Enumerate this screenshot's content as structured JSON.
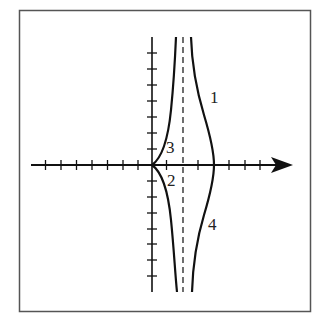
{
  "figure": {
    "frame_color": "#555555",
    "curve_color": "#111111",
    "axes": {
      "x_axis_arrow": true,
      "y_axis_arrow": false,
      "x_ticks_negative": 7,
      "x_ticks_positive": 7,
      "y_ticks_positive": 7,
      "y_ticks_negative": 7
    },
    "asymptote": {
      "style": "dashed",
      "x_units": 2
    },
    "labels": {
      "curve1": "1",
      "curve2": "2",
      "curve3": "3",
      "curve4": "4"
    }
  }
}
